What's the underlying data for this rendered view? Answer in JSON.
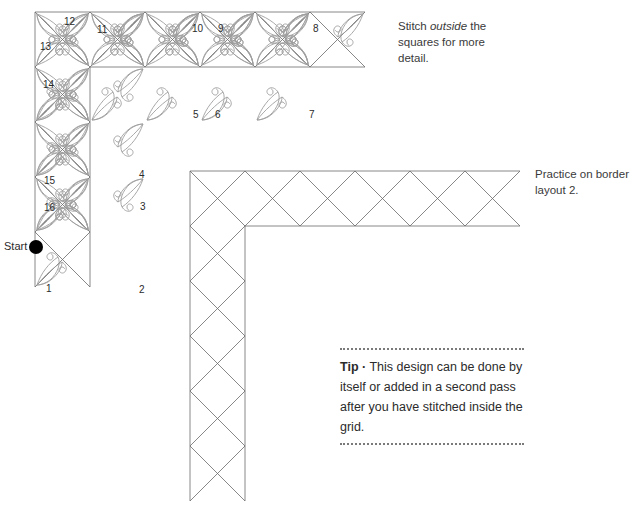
{
  "page": {
    "background": "#ffffff"
  },
  "colors": {
    "grid_line": "#6a6a6a",
    "motif_line": "#9e9e9e",
    "start_dot": "#000000",
    "text": "#2b2b2b",
    "note_text": "#3a3a3a",
    "tip_rule": "#7a7a7a"
  },
  "notes": {
    "stitch_outside": {
      "before": "Stitch ",
      "emphasis": "outside",
      "after": " the squares for more detail."
    },
    "practice": "Practice on border layout 2."
  },
  "start_marker": {
    "label": "Start",
    "dot_x": 36,
    "dot_y": 247,
    "dot_r": 7
  },
  "stitch_numbers": [
    {
      "label": "1",
      "x": 46,
      "y": 284
    },
    {
      "label": "2",
      "x": 139,
      "y": 285
    },
    {
      "label": "3",
      "x": 140,
      "y": 202
    },
    {
      "label": "4",
      "x": 139,
      "y": 170
    },
    {
      "label": "5",
      "x": 193,
      "y": 110
    },
    {
      "label": "6",
      "x": 215,
      "y": 110
    },
    {
      "label": "7",
      "x": 309,
      "y": 110
    },
    {
      "label": "8",
      "x": 313,
      "y": 24
    },
    {
      "label": "9",
      "x": 218,
      "y": 24
    },
    {
      "label": "10",
      "x": 192,
      "y": 24
    },
    {
      "label": "11",
      "x": 97,
      "y": 25
    },
    {
      "label": "12",
      "x": 64,
      "y": 17
    },
    {
      "label": "13",
      "x": 40,
      "y": 42
    },
    {
      "label": "14",
      "x": 43,
      "y": 80
    },
    {
      "label": "15",
      "x": 44,
      "y": 176
    },
    {
      "label": "16",
      "x": 44,
      "y": 203
    }
  ],
  "tip": {
    "word": "Tip",
    "bullet": "·",
    "text": "This design can be done by itself or added in a second pass after you have stitched inside the grid."
  },
  "diagram1": {
    "name": "border-layout-1-with-motifs",
    "origin_x": 35,
    "origin_y": 12,
    "cell": 55,
    "cols_top": 6,
    "rows_left": 5,
    "description": "L-shaped border of squares with on-point diagonals and decorative scroll motifs inside each square"
  },
  "diagram2": {
    "name": "border-layout-2-plain",
    "origin_x": 190,
    "origin_y": 171,
    "cell": 55,
    "cols_top": 6,
    "rows_left": 6,
    "description": "L-shaped plain border grid of squares with crossed diagonals, no motifs"
  }
}
